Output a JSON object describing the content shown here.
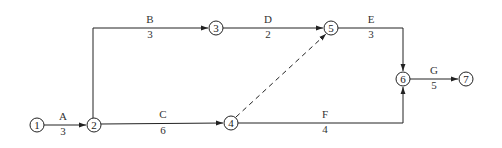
{
  "diagram": {
    "type": "activity-on-arrow network",
    "nodes": [
      {
        "id": "1",
        "x": 37,
        "y": 125
      },
      {
        "id": "2",
        "x": 94,
        "y": 125
      },
      {
        "id": "3",
        "x": 216,
        "y": 28
      },
      {
        "id": "4",
        "x": 231,
        "y": 123
      },
      {
        "id": "5",
        "x": 331,
        "y": 28
      },
      {
        "id": "6",
        "x": 403,
        "y": 79
      },
      {
        "id": "7",
        "x": 466,
        "y": 79
      }
    ],
    "activities": [
      {
        "name": "A",
        "duration": "3",
        "from": "1",
        "to": "2"
      },
      {
        "name": "B",
        "duration": "3",
        "from": "2",
        "to": "3"
      },
      {
        "name": "C",
        "duration": "6",
        "from": "2",
        "to": "4"
      },
      {
        "name": "D",
        "duration": "2",
        "from": "3",
        "to": "5"
      },
      {
        "name": "E",
        "duration": "3",
        "from": "5",
        "to": "6"
      },
      {
        "name": "F",
        "duration": "4",
        "from": "4",
        "to": "6"
      },
      {
        "name": "G",
        "duration": "5",
        "from": "6",
        "to": "7"
      }
    ],
    "dummy_activities": [
      {
        "from": "4",
        "to": "5",
        "style": "dashed"
      }
    ]
  }
}
